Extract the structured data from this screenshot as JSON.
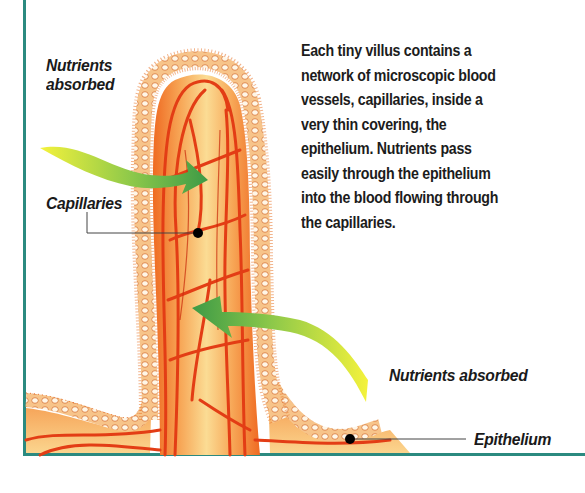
{
  "diagram": {
    "labels": {
      "nutrients_absorbed_top": [
        "Nutrients",
        "absorbed"
      ],
      "capillaries": "Capillaries",
      "nutrients_absorbed_bottom": "Nutrients absorbed",
      "epithelium": "Epithelium"
    },
    "description_lines": [
      "Each tiny villus contains a",
      "network of microscopic blood",
      "vessels, capillaries, inside a",
      "very thin covering, the",
      "epithelium. Nutrients pass",
      "easily through the epithelium",
      "into the blood flowing through",
      "the capillaries."
    ],
    "colors": {
      "frame": "#2b8a80",
      "capillary": "#e8401a",
      "villus_core": "#f9c77a",
      "epithelium": "#fbe3b8",
      "arrow_start": "#f2ef3a",
      "arrow_end": "#3f9a45"
    }
  }
}
